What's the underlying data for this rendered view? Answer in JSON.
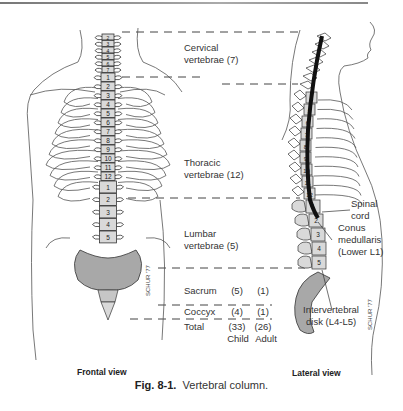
{
  "figure": {
    "caption_label": "Fig. 8-1.",
    "caption_text": "Vertebral column.",
    "frontal_view_label": "Frontal view",
    "lateral_view_label": "Lateral view",
    "regions": [
      {
        "name_line1": "Cervical",
        "name_line2": "vertebrae",
        "count": "(7)"
      },
      {
        "name_line1": "Thoracic",
        "name_line2": "vertebrae",
        "count": "(12)"
      },
      {
        "name_line1": "Lumbar",
        "name_line2": "vertebrae",
        "count": "(5)"
      }
    ],
    "counts_table": {
      "rows": [
        {
          "label": "Sacrum",
          "child": "(5)",
          "adult": "(1)"
        },
        {
          "label": "Coccyx",
          "child": "(4)",
          "adult": "(1)"
        },
        {
          "label": "Total",
          "child": "(33)",
          "adult": "(26)"
        }
      ],
      "column_child": "Child",
      "column_adult": "Adult"
    },
    "annotations": {
      "spinal_cord_line1": "Spinal",
      "spinal_cord_line2": "cord",
      "conus_line1": "Conus",
      "conus_line2": "medullaris",
      "conus_line3": "(Lower L1)",
      "disk_line1": "Intervertebral",
      "disk_line2": "disk (L4-L5)"
    },
    "frontal_numbers": {
      "cervical": [
        "2",
        "3",
        "4",
        "5",
        "6",
        "7"
      ],
      "thoracic": [
        "1",
        "2",
        "3",
        "4",
        "5",
        "6",
        "7",
        "8",
        "9",
        "10",
        "11",
        "12"
      ],
      "lumbar": [
        "1",
        "2",
        "3",
        "4",
        "5"
      ]
    },
    "lateral_numbers": {
      "thoracic": [
        "4",
        "5",
        "6",
        "7",
        "8",
        "9",
        "10",
        "11",
        "12"
      ],
      "lumbar": [
        "1",
        "2",
        "3",
        "4",
        "5"
      ]
    },
    "artist_signature": "SCHUR '77",
    "colors": {
      "bone_fill": "#d9d9d9",
      "sacrum_fill": "#a8a8a8",
      "line": "#333333",
      "spinal_cord": "#111111"
    }
  }
}
